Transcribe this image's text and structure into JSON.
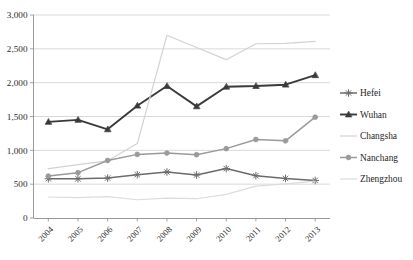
{
  "chart_data": {
    "type": "line",
    "title": "",
    "subtitle": "",
    "xlabel": "",
    "ylabel": "",
    "categories": [
      "2004",
      "2005",
      "2006",
      "2007",
      "2008",
      "2009",
      "2010",
      "2011",
      "2012",
      "2013"
    ],
    "x": [
      2004,
      2005,
      2006,
      2007,
      2008,
      2009,
      2010,
      2011,
      2012,
      2013
    ],
    "ylim": [
      0,
      3000
    ],
    "ytick_values": [
      0,
      500,
      1000,
      1500,
      2000,
      2500,
      3000
    ],
    "ytick_labels": [
      "0",
      "500",
      "1,000",
      "1,500",
      "2,000",
      "2,500",
      "3,000"
    ],
    "grid": "horizontal",
    "legend_position": "right",
    "series": [
      {
        "name": "Hefei",
        "marker": "asterisk",
        "color": "#6b6b6b",
        "values": [
          580,
          580,
          590,
          640,
          680,
          635,
          730,
          625,
          585,
          555
        ]
      },
      {
        "name": "Wuhan",
        "marker": "triangle",
        "color": "#3a3a3a",
        "values": [
          1420,
          1450,
          1310,
          1660,
          1950,
          1650,
          1940,
          1950,
          1970,
          2110
        ]
      },
      {
        "name": "Changsha",
        "marker": "none",
        "color": "#d2d2d2",
        "values": [
          730,
          790,
          845,
          1100,
          2700,
          2520,
          2340,
          2575,
          2580,
          2610
        ]
      },
      {
        "name": "Nanchang",
        "marker": "circle",
        "color": "#9a9a9a",
        "values": [
          620,
          670,
          850,
          940,
          960,
          935,
          1025,
          1160,
          1140,
          1490
        ]
      },
      {
        "name": "Zhengzhou",
        "marker": "none",
        "color": "#dcdcdc",
        "values": [
          310,
          300,
          315,
          270,
          295,
          285,
          350,
          470,
          505,
          545
        ]
      }
    ]
  },
  "legend": {
    "entries": [
      {
        "label": "Hefei"
      },
      {
        "label": "Wuhan"
      },
      {
        "label": "Changsha"
      },
      {
        "label": "Nanchang"
      },
      {
        "label": "Zhengzhou"
      }
    ]
  },
  "axes": {
    "y_axis_name": "value-axis",
    "x_axis_name": "year-axis"
  }
}
